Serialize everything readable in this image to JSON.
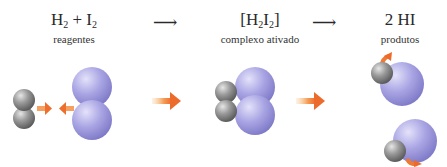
{
  "stages": [
    {
      "formula_parts": [
        "H",
        "2",
        " + I",
        "2"
      ],
      "label": "reagentes"
    },
    {
      "formula_parts": [
        "[H",
        "2",
        "I",
        "2",
        "]"
      ],
      "label": "complexo ativado"
    },
    {
      "formula": "2 HI",
      "label": "produtos"
    }
  ],
  "reaction_arrows": [
    "⟶",
    "⟶"
  ],
  "colors": {
    "hydrogen_atom": "#8a8a8a",
    "iodine_atom": "#a9a6e0",
    "motion_arrow": "#f07a35"
  }
}
